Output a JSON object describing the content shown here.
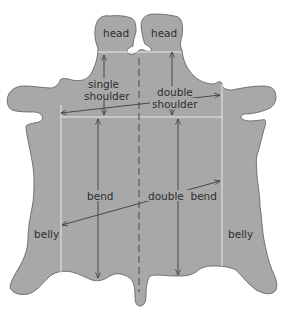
{
  "colors": {
    "hide": "#a8a8a8",
    "outline": "#5a5a5a",
    "division_lines": "#e8e8e8",
    "arrows": "#3c3c3c",
    "text": "#2e2e2e",
    "background": "#ffffff"
  },
  "labels": {
    "head_left": "head",
    "head_right": "head",
    "single_shoulder_line1": "single",
    "single_shoulder_line2": "shoulder",
    "double_shoulder_line1": "double",
    "double_shoulder_line2": "shoulder",
    "bend": "bend",
    "double_bend": "double  bend",
    "belly_left": "belly",
    "belly_right": "belly"
  },
  "regions": [
    {
      "name": "head",
      "count": 2
    },
    {
      "name": "single shoulder"
    },
    {
      "name": "double shoulder"
    },
    {
      "name": "bend"
    },
    {
      "name": "double bend"
    },
    {
      "name": "belly",
      "count": 2
    }
  ],
  "annotations": {
    "center_line_style": "dashed",
    "division_line_style": "solid-white"
  }
}
